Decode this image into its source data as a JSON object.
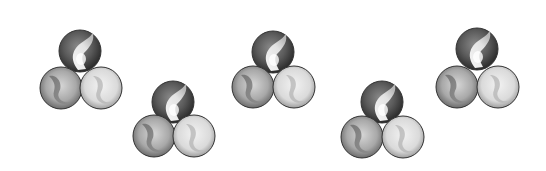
{
  "scene": {
    "width": 546,
    "height": 171,
    "background": "#ffffff",
    "description": "Five clusters of three grayscale marbles each, arranged in an alternating high/low zigzag",
    "marble_radius": 21,
    "colors": {
      "dark_marble_edge": "#2e2e2e",
      "dark_marble_mid": "#6a6a6a",
      "medium_marble_edge": "#5a5a5a",
      "medium_marble_mid": "#b8b8b8",
      "light_marble_edge": "#6e6e6e",
      "light_marble_mid": "#e6e6e6",
      "swirl_white": "#f4f4f4",
      "swirl_dark": "#7a7a7a",
      "outline": "#333333"
    },
    "groups": [
      {
        "name": "marble-group-1",
        "position": "high",
        "top": {
          "cx": 80,
          "cy": 51
        },
        "bottom_left": {
          "cx": 61,
          "cy": 88
        },
        "bottom_right": {
          "cx": 101,
          "cy": 88
        }
      },
      {
        "name": "marble-group-2",
        "position": "low",
        "top": {
          "cx": 173,
          "cy": 102
        },
        "bottom_left": {
          "cx": 154,
          "cy": 136
        },
        "bottom_right": {
          "cx": 194,
          "cy": 136
        }
      },
      {
        "name": "marble-group-3",
        "position": "high",
        "top": {
          "cx": 273,
          "cy": 52
        },
        "bottom_left": {
          "cx": 253,
          "cy": 87
        },
        "bottom_right": {
          "cx": 294,
          "cy": 87
        }
      },
      {
        "name": "marble-group-4",
        "position": "low",
        "top": {
          "cx": 382,
          "cy": 102
        },
        "bottom_left": {
          "cx": 362,
          "cy": 137
        },
        "bottom_right": {
          "cx": 403,
          "cy": 137
        }
      },
      {
        "name": "marble-group-5",
        "position": "high",
        "top": {
          "cx": 477,
          "cy": 49
        },
        "bottom_left": {
          "cx": 457,
          "cy": 87
        },
        "bottom_right": {
          "cx": 498,
          "cy": 87
        }
      }
    ]
  }
}
